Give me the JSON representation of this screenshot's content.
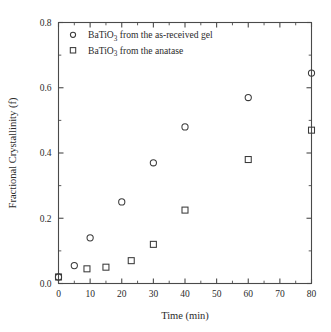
{
  "chart_data": {
    "type": "scatter",
    "title": "",
    "xlabel": "Time (min)",
    "ylabel": "Fractional Crystallinity (f)",
    "xlim": [
      0,
      80
    ],
    "ylim": [
      0,
      0.8
    ],
    "xticks": [
      0,
      10,
      20,
      30,
      40,
      50,
      60,
      70,
      80
    ],
    "xtick_labels": [
      "0",
      "10",
      "20",
      "30",
      "40",
      "50",
      "60",
      "70",
      "80"
    ],
    "yticks": [
      0.0,
      0.2,
      0.4,
      0.6,
      0.8
    ],
    "ytick_labels": [
      "0.0",
      "0.2",
      "0.4",
      "0.6",
      "0.8"
    ],
    "x_minor_interval": 5,
    "y_minor_interval": 0.1,
    "grid": false,
    "legend_position": "upper-left-inside",
    "series": [
      {
        "name": "BaTiO3 from the as-received gel",
        "label_prefix": "BaTiO",
        "label_sub": "3",
        "label_suffix": " from the as-received gel",
        "marker": "circle",
        "color": "#3a3a3a",
        "x": [
          0,
          5,
          10,
          20,
          30,
          40,
          60,
          80
        ],
        "y": [
          0.02,
          0.055,
          0.14,
          0.25,
          0.37,
          0.48,
          0.57,
          0.645
        ]
      },
      {
        "name": "BaTiO3 from the anatase",
        "label_prefix": "BaTiO",
        "label_sub": "3",
        "label_suffix": " from the anatase",
        "marker": "square",
        "color": "#3a3a3a",
        "x": [
          0,
          9,
          15,
          23,
          30,
          40,
          60,
          80
        ],
        "y": [
          0.02,
          0.045,
          0.05,
          0.07,
          0.12,
          0.225,
          0.38,
          0.47
        ]
      }
    ]
  }
}
